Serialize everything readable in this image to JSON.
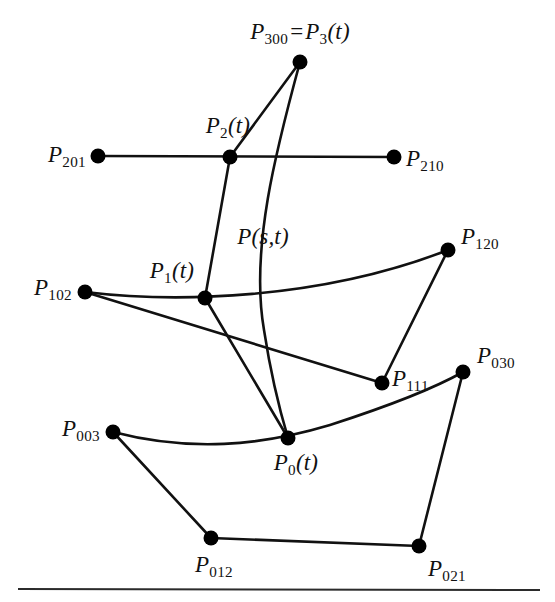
{
  "figure": {
    "title_notation": "Cubic Bezier triangle with de Casteljau construction",
    "stroke_color": "#111111",
    "point_color": "#000000",
    "background_color": "#ffffff",
    "rule_color": "#2b2b2b",
    "width": 555,
    "height": 602
  },
  "labels": {
    "p300_eq_p3t": {
      "base": "P",
      "sub": "300",
      "eq": "=",
      "base2": "P",
      "sub2": "3",
      "arg": "(t)",
      "full_text": "P300 = P3(t)",
      "x": 300,
      "y": 33,
      "anchor": "center"
    },
    "p2t": {
      "base": "P",
      "sub": "2",
      "arg": "(t)",
      "full_text": "P2(t)",
      "x": 228,
      "y": 127,
      "anchor": "center"
    },
    "p201": {
      "base": "P",
      "sub": "201",
      "full_text": "P201",
      "x": 86,
      "y": 156,
      "anchor": "right"
    },
    "p210": {
      "base": "P",
      "sub": "210",
      "full_text": "P210",
      "x": 406,
      "y": 160,
      "anchor": "left"
    },
    "pst": {
      "base": "P",
      "arg": "(s,t)",
      "full_text": "P(s,t)",
      "x": 263,
      "y": 236,
      "anchor": "center"
    },
    "p120": {
      "base": "P",
      "sub": "120",
      "full_text": "P120",
      "x": 461,
      "y": 238,
      "anchor": "left"
    },
    "p1t": {
      "base": "P",
      "sub": "1",
      "arg": "(t)",
      "full_text": "P1(t)",
      "x": 172,
      "y": 272,
      "anchor": "center"
    },
    "p102": {
      "base": "P",
      "sub": "102",
      "full_text": "P102",
      "x": 72,
      "y": 289,
      "anchor": "right"
    },
    "p111": {
      "base": "P",
      "sub": "111",
      "full_text": "P111",
      "x": 392,
      "y": 380,
      "anchor": "left"
    },
    "p030": {
      "base": "P",
      "sub": "030",
      "full_text": "P030",
      "x": 477,
      "y": 357,
      "anchor": "left"
    },
    "p003": {
      "base": "P",
      "sub": "003",
      "full_text": "P003",
      "x": 100,
      "y": 430,
      "anchor": "right"
    },
    "p0t": {
      "base": "P",
      "sub": "0",
      "arg": "(t)",
      "full_text": "P0(t)",
      "x": 296,
      "y": 464,
      "anchor": "center"
    },
    "p012": {
      "base": "P",
      "sub": "012",
      "full_text": "P012",
      "x": 214,
      "y": 566,
      "anchor": "center"
    },
    "p021": {
      "base": "P",
      "sub": "021",
      "full_text": "P021",
      "x": 428,
      "y": 570,
      "anchor": "left"
    }
  },
  "geometry": {
    "points": [
      {
        "name": "P300",
        "x": 300,
        "y": 62,
        "r": 7
      },
      {
        "name": "P201",
        "x": 98,
        "y": 156,
        "r": 7
      },
      {
        "name": "P2t",
        "x": 230,
        "y": 157,
        "r": 7
      },
      {
        "name": "P210",
        "x": 394,
        "y": 157,
        "r": 7
      },
      {
        "name": "P120",
        "x": 448,
        "y": 250,
        "r": 7
      },
      {
        "name": "P102",
        "x": 85,
        "y": 292,
        "r": 7
      },
      {
        "name": "P1t",
        "x": 205,
        "y": 298,
        "r": 7
      },
      {
        "name": "P030",
        "x": 463,
        "y": 372,
        "r": 7
      },
      {
        "name": "P111",
        "x": 382,
        "y": 383,
        "r": 7
      },
      {
        "name": "P003",
        "x": 113,
        "y": 432,
        "r": 7
      },
      {
        "name": "P0t",
        "x": 288,
        "y": 438,
        "r": 7
      }
    ],
    "points_bottom": [
      {
        "name": "P012",
        "x": 211,
        "y": 538,
        "r": 7
      },
      {
        "name": "P021",
        "x": 419,
        "y": 546,
        "r": 7
      }
    ],
    "edges_straight": [
      {
        "name": "edge-p201-p210",
        "x1": 98,
        "y1": 156,
        "x2": 394,
        "y2": 157
      },
      {
        "name": "edge-p102-p111",
        "x1": 85,
        "y1": 292,
        "x2": 382,
        "y2": 383
      },
      {
        "name": "edge-p111-p120",
        "x1": 382,
        "y1": 383,
        "x2": 448,
        "y2": 250
      },
      {
        "name": "edge-p003-p012",
        "x1": 113,
        "y1": 432,
        "x2": 211,
        "y2": 538
      },
      {
        "name": "edge-p012-p021",
        "x1": 211,
        "y1": 538,
        "x2": 419,
        "y2": 546
      },
      {
        "name": "edge-p021-p030",
        "x1": 419,
        "y1": 546,
        "x2": 463,
        "y2": 372
      },
      {
        "name": "edge-p300-p2t",
        "x1": 300,
        "y1": 62,
        "x2": 230,
        "y2": 157
      },
      {
        "name": "edge-p2t-p1t",
        "x1": 230,
        "y1": 157,
        "x2": 205,
        "y2": 298
      },
      {
        "name": "edge-p1t-p0t",
        "x1": 205,
        "y1": 298,
        "x2": 288,
        "y2": 438
      }
    ],
    "curves": [
      {
        "name": "curve-pst-main",
        "d": "M 300 62 C 276 150, 250 250, 264 330 C 272 382, 282 418, 288 438"
      },
      {
        "name": "curve-p102-p120",
        "d": "M 85 292 C 175 303, 320 300, 448 250"
      },
      {
        "name": "curve-p003-p030",
        "d": "M 113 432 C 190 452, 260 446, 330 425 C 395 404, 440 385, 463 372"
      }
    ],
    "rule_line": {
      "name": "bottom-rule",
      "x1": 18,
      "y1": 588,
      "x2": 540,
      "y2": 590
    }
  }
}
